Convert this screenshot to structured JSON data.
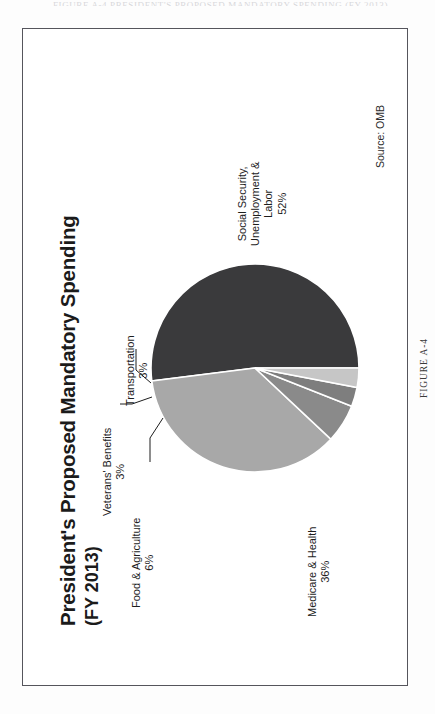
{
  "page": {
    "running_head": "FIGURE A-4  PRESIDENT'S PROPOSED MANDATORY SPENDING (FY 2013)",
    "figure_caption": "FIGURE A-4"
  },
  "chart": {
    "title": "President's Proposed Mandatory Spending",
    "subtitle": "(FY 2013)",
    "source": "Source: OMB"
  },
  "chart_data": {
    "type": "pie",
    "title": "President's Proposed Mandatory Spending",
    "subtitle": "(FY 2013)",
    "source": "Source: OMB",
    "xlabel": "",
    "ylabel": "",
    "legend": "none",
    "grid": false,
    "units": "percent",
    "total": 100,
    "categories": [
      "Social Security, Unemployment & Labor",
      "Medicare & Health",
      "Food & Agriculture",
      "Veterans' Benefits",
      "Transportation"
    ],
    "values": [
      52,
      36,
      6,
      3,
      3
    ],
    "colors": [
      "#3a3a3c",
      "#a8a8a8",
      "#8a8a8a",
      "#7e7e7e",
      "#c6c6c6"
    ],
    "slices": [
      {
        "label": "Social Security,\nUnemployment &\nLabor",
        "label_line1": "Social Security,",
        "label_line2": "Unemployment &",
        "label_line3": "Labor",
        "value": 52,
        "value_text": "52%",
        "color": "#3a3a3c"
      },
      {
        "label": "Medicare & Health",
        "label_line1": "Medicare & Health",
        "value": 36,
        "value_text": "36%",
        "color": "#a8a8a8"
      },
      {
        "label": "Food & Agriculture",
        "label_line1": "Food & Agriculture",
        "value": 6,
        "value_text": "6%",
        "color": "#8a8a8a"
      },
      {
        "label": "Veterans' Benefits",
        "label_line1": "Veterans' Benefits",
        "value": 3,
        "value_text": "3%",
        "color": "#7e7e7e"
      },
      {
        "label": "Transportation",
        "label_line1": "Transportation",
        "value": 3,
        "value_text": "3%",
        "color": "#c6c6c6"
      }
    ]
  }
}
